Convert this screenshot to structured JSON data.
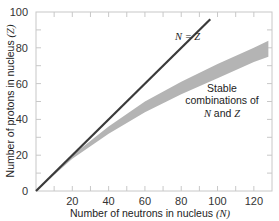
{
  "chart_data": {
    "type": "area",
    "title": "",
    "xlabel": "Number of neutrons in nucleus (N)",
    "ylabel": "Number of protons in nucleus (Z)",
    "xlim": [
      0,
      130
    ],
    "ylim": [
      0,
      100
    ],
    "x_ticks": [
      20,
      40,
      60,
      80,
      100,
      120
    ],
    "y_ticks": [
      0,
      20,
      40,
      60,
      80,
      100
    ],
    "grid": false,
    "series": [
      {
        "name": "N = Z",
        "type": "line",
        "x": [
          0,
          96
        ],
        "y": [
          0,
          96
        ],
        "color": "#3a3a3a"
      },
      {
        "name": "Stable combinations of N and Z",
        "type": "band",
        "color": "#b4b4b4",
        "x": [
          0,
          20,
          40,
          60,
          80,
          100,
          120,
          128
        ],
        "lower": [
          0,
          18,
          32,
          44,
          54,
          63,
          72,
          75
        ],
        "upper": [
          0,
          20,
          36,
          50,
          61,
          71,
          80,
          84
        ]
      }
    ],
    "annotations": [
      {
        "text": "N = Z",
        "x": 79,
        "y": 85
      },
      {
        "text": "Stable combinations of N and Z",
        "x": 100,
        "y": 50
      }
    ]
  },
  "labels": {
    "xlabel_pre": "Number of neutrons in nucleus ",
    "xlabel_var": "(N)",
    "ylabel_pre": "Number of protons in nucleus ",
    "ylabel_var": "(Z)",
    "nz": "N = Z",
    "stable1": "Stable",
    "stable2": "combinations of",
    "stable3_a": "N",
    "stable3_b": " and ",
    "stable3_c": "Z"
  }
}
